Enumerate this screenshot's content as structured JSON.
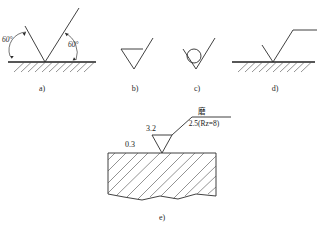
{
  "figure": {
    "parts": [
      {
        "id": "a",
        "label": "a)",
        "description": "basic symbol geometry with 60 degree angles on hatched surface",
        "angle_left": "60°",
        "angle_right": "60°"
      },
      {
        "id": "b",
        "label": "b)",
        "description": "symbol with closed triangle, material removal required"
      },
      {
        "id": "c",
        "label": "c)",
        "description": "symbol with circle, material removal not permitted"
      },
      {
        "id": "d",
        "label": "d)",
        "description": "symbol with horizontal extension bar on hatched surface"
      },
      {
        "id": "e",
        "label": "e)",
        "description": "applied example on hatched section block",
        "annotations": {
          "machining_allowance": "0.3",
          "roughness_value": "3.2",
          "process_note": "磨",
          "extension_value": "2.5(Rz=8)"
        }
      }
    ]
  },
  "colors": {
    "line": "#2b2b2b",
    "hatch": "#4a4a4a",
    "text": "#1a1a1a",
    "background": "#ffffff"
  }
}
